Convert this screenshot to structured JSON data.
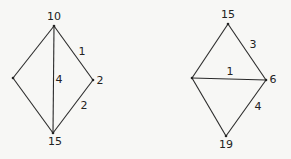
{
  "diagrams": [
    {
      "vertices": [
        {
          "id": "top",
          "x": 54,
          "y": 26,
          "label": "10",
          "lx": 54,
          "ly": 17
        },
        {
          "id": "left",
          "x": 13,
          "y": 78,
          "label": "",
          "lx": 0,
          "ly": 0
        },
        {
          "id": "right",
          "x": 93,
          "y": 80,
          "label": "2",
          "lx": 100,
          "ly": 81
        },
        {
          "id": "bottom",
          "x": 53,
          "y": 133,
          "label": "15",
          "lx": 55,
          "ly": 142
        }
      ],
      "edges": [
        {
          "from": "top",
          "to": "left",
          "label": "",
          "lx": 0,
          "ly": 0
        },
        {
          "from": "top",
          "to": "right",
          "label": "1",
          "lx": 82,
          "ly": 52
        },
        {
          "from": "top",
          "to": "bottom",
          "label": "4",
          "lx": 59,
          "ly": 80
        },
        {
          "from": "left",
          "to": "bottom",
          "label": "",
          "lx": 0,
          "ly": 0
        },
        {
          "from": "right",
          "to": "bottom",
          "label": "2",
          "lx": 84,
          "ly": 106
        }
      ]
    },
    {
      "vertices": [
        {
          "id": "top",
          "x": 228,
          "y": 24,
          "label": "15",
          "lx": 228,
          "ly": 15
        },
        {
          "id": "left",
          "x": 192,
          "y": 78,
          "label": "",
          "lx": 0,
          "ly": 0
        },
        {
          "id": "right",
          "x": 266,
          "y": 80,
          "label": "6",
          "lx": 273,
          "ly": 80
        },
        {
          "id": "bottom",
          "x": 226,
          "y": 136,
          "label": "19",
          "lx": 226,
          "ly": 145
        }
      ],
      "edges": [
        {
          "from": "top",
          "to": "left",
          "label": "",
          "lx": 0,
          "ly": 0
        },
        {
          "from": "top",
          "to": "right",
          "label": "3",
          "lx": 253,
          "ly": 45
        },
        {
          "from": "left",
          "to": "right",
          "label": "1",
          "lx": 230,
          "ly": 72
        },
        {
          "from": "left",
          "to": "bottom",
          "label": "",
          "lx": 0,
          "ly": 0
        },
        {
          "from": "right",
          "to": "bottom",
          "label": "4",
          "lx": 258,
          "ly": 107
        }
      ]
    }
  ]
}
